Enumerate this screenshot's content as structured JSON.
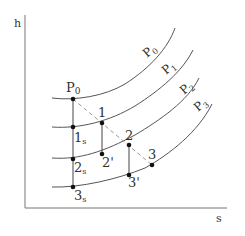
{
  "diagram": {
    "title": "",
    "axes": {
      "y_label": "h",
      "x_label": "s"
    },
    "isobars": [
      {
        "label": "P",
        "subscript": "0"
      },
      {
        "label": "P",
        "subscript": "1"
      },
      {
        "label": "P",
        "subscript": "2"
      },
      {
        "label": "P",
        "subscript": "3"
      }
    ],
    "points": {
      "P0": {
        "label": "P",
        "subscript": "0"
      },
      "p1": {
        "label": "1"
      },
      "p2": {
        "label": "2"
      },
      "p3": {
        "label": "3"
      },
      "p1s": {
        "label": "1",
        "subscript": "s"
      },
      "p2s": {
        "label": "2",
        "subscript": "s"
      },
      "p3s": {
        "label": "3",
        "subscript": "s"
      },
      "p2prime": {
        "label": "2'"
      },
      "p3prime": {
        "label": "3'"
      }
    },
    "colors": {
      "line": "#555555",
      "dashed": "#999999",
      "point": "#111111"
    }
  }
}
